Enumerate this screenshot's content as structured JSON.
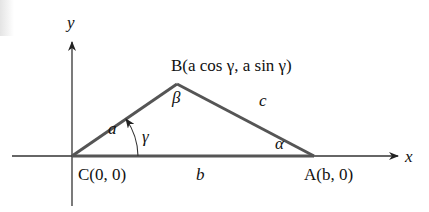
{
  "diagram": {
    "colors": {
      "axis": "#222222",
      "side": "#555555",
      "text": "#111111"
    },
    "axes": {
      "x_label": "x",
      "y_label": "y"
    },
    "vertices": {
      "A": {
        "label": "A(b, 0)"
      },
      "B": {
        "label": "B(a cos γ, a sin γ)"
      },
      "C": {
        "label": "C(0, 0)"
      }
    },
    "sides": {
      "a": "a",
      "b": "b",
      "c": "c"
    },
    "angles": {
      "alpha": "α",
      "beta": "β",
      "gamma": "γ"
    }
  }
}
